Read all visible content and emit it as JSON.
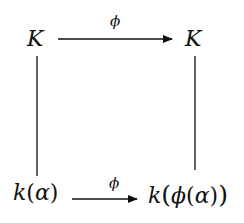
{
  "diagram": {
    "type": "commutative-square",
    "nodes": {
      "top_left": "K",
      "top_right": "K",
      "bottom_left": {
        "fn": "k",
        "open": "(",
        "arg": "α",
        "close": ")"
      },
      "bottom_right": {
        "fn": "k",
        "open": "(",
        "inner_fn": "ϕ",
        "inner_open": "(",
        "arg": "α",
        "inner_close": ")",
        "close": ")"
      }
    },
    "edges": {
      "top": {
        "from": "top_left",
        "to": "top_right",
        "label": "ϕ",
        "arrow": true
      },
      "bottom": {
        "from": "bottom_left",
        "to": "bottom_right",
        "label": "ϕ",
        "arrow": true
      },
      "left": {
        "from": "top_left",
        "to": "bottom_left",
        "arrow": false
      },
      "right": {
        "from": "top_right",
        "to": "bottom_right",
        "arrow": false
      }
    },
    "colors": {
      "ink": "#111111",
      "background": "#ffffff"
    }
  }
}
